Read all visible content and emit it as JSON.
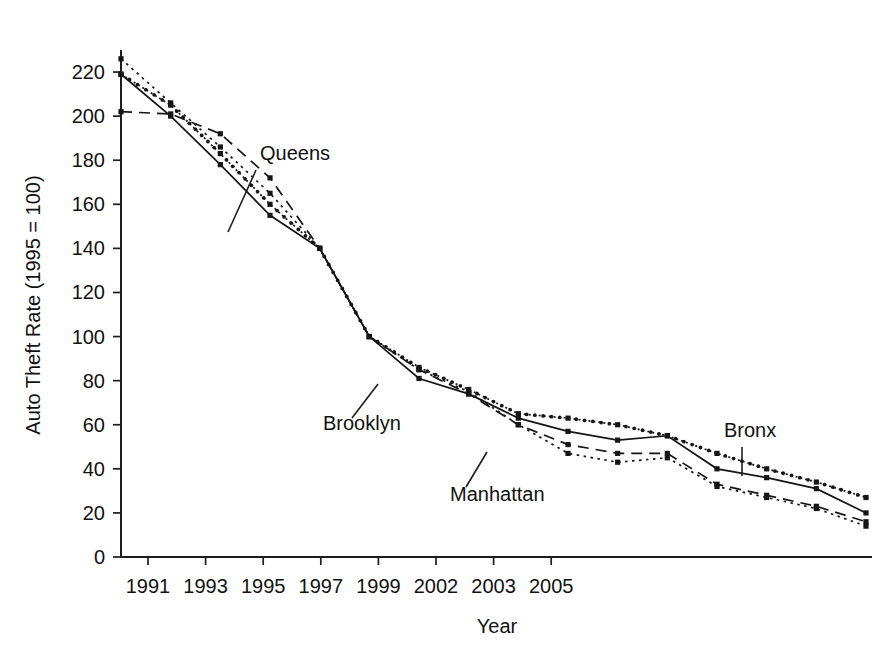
{
  "chart_data": {
    "type": "line",
    "title": "",
    "xlabel": "Year",
    "ylabel": "Auto Theft Rate (1995 = 100)",
    "xlim": [
      1990,
      2006
    ],
    "ylim": [
      0,
      230
    ],
    "grid": false,
    "legend_position": "inline-annotations",
    "y_ticks": [
      0,
      20,
      40,
      60,
      80,
      100,
      120,
      140,
      160,
      180,
      200,
      220
    ],
    "y_tick_labels": [
      "0",
      "20",
      "40",
      "60",
      "80",
      "100",
      "120",
      "140",
      "160",
      "180",
      "200",
      "220"
    ],
    "x_ticks": [
      1991,
      1993,
      1995,
      1997,
      1999,
      2002,
      2003,
      2005
    ],
    "x_tick_labels": [
      "1991",
      "1993",
      "1995",
      "1997",
      "1999",
      "2002",
      "2003",
      "2005"
    ],
    "x": [
      1990,
      1991,
      1992,
      1993,
      1994,
      1995,
      1996,
      1997,
      1998,
      1999,
      2000,
      2002,
      2003,
      2004,
      2005,
      2006
    ],
    "series": [
      {
        "name": "Bronx",
        "style": "dotted-dense-markers",
        "values": [
          219,
          205,
          183,
          160,
          140,
          100,
          86,
          76,
          65,
          63,
          60,
          55,
          47,
          40,
          34,
          27
        ]
      },
      {
        "name": "Brooklyn",
        "style": "solid",
        "values": [
          219,
          200,
          178,
          155,
          140,
          100,
          81,
          74,
          63,
          57,
          53,
          55,
          40,
          36,
          31,
          20
        ]
      },
      {
        "name": "Queens",
        "style": "dashed",
        "values": [
          202,
          201,
          192,
          172,
          140,
          100,
          85,
          74,
          60,
          51,
          47,
          47,
          33,
          28,
          23,
          16
        ]
      },
      {
        "name": "Manhattan",
        "style": "dotted",
        "values": [
          226,
          206,
          186,
          165,
          140,
          100,
          85,
          75,
          60,
          47,
          43,
          45,
          32,
          27,
          22,
          14
        ]
      }
    ],
    "annotations": [
      {
        "label": "Queens",
        "x_px": 260,
        "y_px": 160
      },
      {
        "label": "Brooklyn",
        "x_px": 323,
        "y_px": 430
      },
      {
        "label": "Manhattan",
        "x_px": 450,
        "y_px": 501
      },
      {
        "label": "Bronx",
        "x_px": 724,
        "y_px": 437
      }
    ]
  },
  "axis": {
    "y_title": "Auto Theft Rate (1995 = 100)",
    "x_title": "Year"
  }
}
